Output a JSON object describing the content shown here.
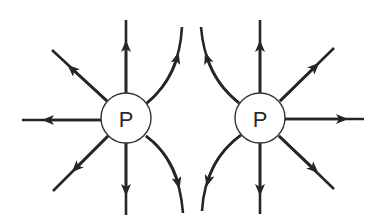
{
  "diagram": {
    "type": "electric-field-lines",
    "colors": {
      "line": "#262626",
      "charge_fill": "#ffffff",
      "charge_stroke": "#333333"
    },
    "charges": [
      {
        "id": "left",
        "label": "P",
        "cx": 126,
        "cy": 118,
        "r": 25
      },
      {
        "id": "right",
        "label": "P",
        "cx": 260,
        "cy": 118,
        "r": 25
      }
    ],
    "arrow_direction": "outward"
  }
}
